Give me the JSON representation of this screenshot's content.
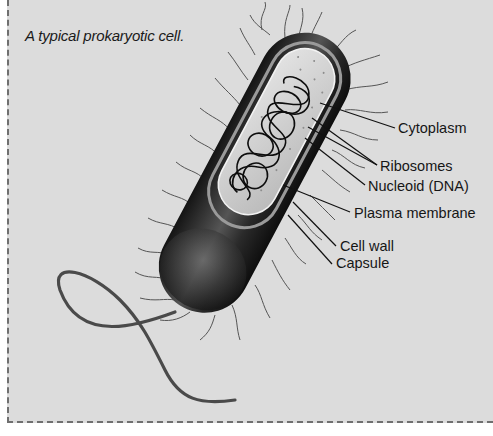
{
  "caption": "A typical prokaryotic cell.",
  "labels": [
    {
      "id": "cytoplasm",
      "text": "Cytoplasm",
      "x": 398,
      "y": 120
    },
    {
      "id": "ribosomes",
      "text": "Ribosomes",
      "x": 380,
      "y": 158
    },
    {
      "id": "nucleoid",
      "text": "Nucleoid (DNA)",
      "x": 368,
      "y": 178
    },
    {
      "id": "plasma-membrane",
      "text": "Plasma membrane",
      "x": 354,
      "y": 205
    },
    {
      "id": "cell-wall",
      "text": "Cell wall",
      "x": 340,
      "y": 238
    },
    {
      "id": "capsule",
      "text": "Capsule",
      "x": 336,
      "y": 255
    }
  ],
  "colors": {
    "background": "#dcdcdc",
    "border": "#6f6f6f",
    "capsule_dark": "#1c1c1c",
    "cytoplasm": "#c9c9c9",
    "flagellum": "#4a4a4a"
  }
}
